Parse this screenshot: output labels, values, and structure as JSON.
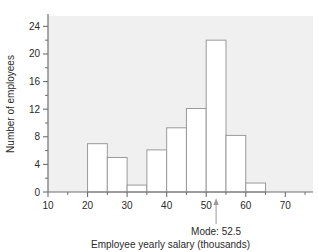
{
  "chart_data": {
    "type": "bar",
    "title": "",
    "subtitle": "",
    "xlabel": "Employee yearly salary (thousands)",
    "ylabel": "Number of employees",
    "xlim": [
      10,
      77
    ],
    "ylim": [
      0,
      25.5
    ],
    "grid": false,
    "legend": null,
    "bin_width": 5,
    "bin_edges": [
      20,
      25,
      30,
      35,
      40,
      45,
      50,
      55,
      60,
      65
    ],
    "categories": [
      "20-25",
      "25-30",
      "30-35",
      "35-40",
      "40-45",
      "45-50",
      "50-55",
      "55-60",
      "60-65"
    ],
    "values": [
      7,
      5,
      1,
      6.1,
      9.3,
      12.1,
      22,
      8.2,
      1.3
    ],
    "xticks": [
      10,
      20,
      30,
      40,
      50,
      60,
      70
    ],
    "xtick_labels": [
      "10",
      "20",
      "30",
      "40",
      "50",
      "60",
      "70"
    ],
    "xminor_ticks": [
      15,
      25,
      35,
      45,
      55,
      65,
      75
    ],
    "yticks": [
      0,
      4,
      8,
      12,
      16,
      20,
      24
    ],
    "ytick_labels": [
      "0",
      "4",
      "8",
      "12",
      "16",
      "20",
      "24"
    ],
    "yminor_ticks": [
      2,
      6,
      10,
      14,
      18,
      22
    ],
    "annotations": [
      {
        "name": "mode",
        "label": "Mode: 52.5",
        "x": 52.5,
        "marker": "triangle-up"
      }
    ],
    "colors": {
      "plot_background": "#f0f0f0",
      "page_background": "#ffffff",
      "bar_fill": "#ffffff",
      "bar_stroke": "#9a9a9a",
      "axis_line": "#6f6f6f",
      "tick_color": "#6f6f6f",
      "text": "#2a2a2a",
      "annotation_line": "#9a9a9a"
    }
  },
  "annotation": {
    "mode_label": "Mode: 52.5"
  },
  "axes": {
    "x_title": "Employee yearly salary (thousands)",
    "y_title": "Number of employees"
  }
}
